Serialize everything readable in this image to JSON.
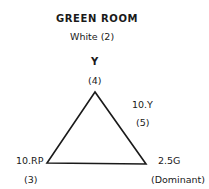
{
  "title": "GREEN ROOM",
  "subtitle": "White (2)",
  "vertices": {
    "top": {
      "label": "Y",
      "value": "(4)"
    },
    "side": {
      "label": "10.Y",
      "value": "(5)"
    },
    "bottom_left": {
      "label": "10.RP",
      "value": "(3)"
    },
    "bottom_right": {
      "label": "2.5G",
      "value": "(Dominant)"
    }
  }
}
